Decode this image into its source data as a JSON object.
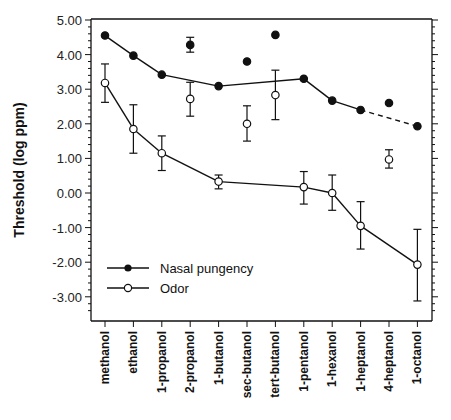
{
  "chart_data": {
    "type": "line",
    "title": "",
    "xlabel": "",
    "ylabel": "Threshold  (log  ppm)",
    "ylim": [
      -3.5,
      5.0
    ],
    "yticks": [
      "5.00",
      "4.00",
      "3.00",
      "2.00",
      "1.00",
      "0.00",
      "-1.00",
      "-2.00",
      "-3.00"
    ],
    "ytick_values": [
      5,
      4,
      3,
      2,
      1,
      0,
      -1,
      -2,
      -3
    ],
    "grid": false,
    "legend_position": "lower left",
    "categories": [
      "methanol",
      "ethanol",
      "1-propanol",
      "2-propanol",
      "1-butanol",
      "sec-butanol",
      "tert-butanol",
      "1-pentanol",
      "1-hexanol",
      "1-heptanol",
      "4-heptanol",
      "1-octanol"
    ],
    "series": [
      {
        "name": "Nasal pungency",
        "marker": "filled-circle",
        "values": [
          4.55,
          3.97,
          3.42,
          4.28,
          3.09,
          3.8,
          4.57,
          3.3,
          2.67,
          2.4,
          2.6,
          1.93
        ],
        "err_high": [
          null,
          null,
          null,
          4.5,
          null,
          null,
          null,
          null,
          null,
          null,
          null,
          null
        ],
        "err_low": [
          null,
          null,
          null,
          4.07,
          null,
          null,
          null,
          null,
          null,
          null,
          null,
          null
        ],
        "connected": [
          true,
          true,
          true,
          false,
          true,
          false,
          false,
          true,
          true,
          true,
          false,
          true
        ],
        "dashed_segment": [
          "1-heptanol",
          "1-octanol"
        ]
      },
      {
        "name": "Odor",
        "marker": "open-circle",
        "values": [
          3.18,
          1.85,
          1.15,
          2.72,
          0.33,
          2.0,
          2.83,
          0.17,
          0.0,
          -0.95,
          0.97,
          -2.07
        ],
        "err_high": [
          3.73,
          2.55,
          1.65,
          3.2,
          0.52,
          2.52,
          3.55,
          0.62,
          0.52,
          -0.25,
          1.25,
          -1.05
        ],
        "err_low": [
          2.62,
          1.15,
          0.65,
          2.22,
          0.12,
          1.5,
          2.12,
          -0.32,
          -0.5,
          -1.62,
          0.72,
          -3.12
        ],
        "connected": [
          true,
          true,
          true,
          false,
          true,
          false,
          false,
          true,
          true,
          true,
          false,
          true
        ]
      }
    ]
  },
  "legend": {
    "items": [
      {
        "label": "Nasal pungency",
        "marker": "filled-circle"
      },
      {
        "label": "Odor",
        "marker": "open-circle"
      }
    ]
  }
}
